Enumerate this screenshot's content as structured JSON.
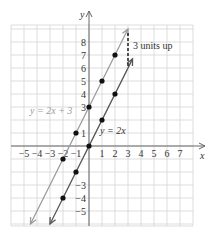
{
  "chart_data": {
    "type": "line",
    "title": "",
    "xlabel": "x",
    "ylabel": "y",
    "xlim": [
      -6,
      8
    ],
    "ylim": [
      -6,
      9
    ],
    "grid": true,
    "x_ticks": [
      -5,
      -4,
      -3,
      -2,
      -1,
      1,
      2,
      3,
      4,
      5,
      6,
      7
    ],
    "y_ticks": [
      -5,
      -4,
      -3,
      1,
      3,
      4,
      5,
      6,
      7,
      8
    ],
    "series": [
      {
        "name": "y = 2x + 3",
        "slope": 2,
        "intercept": 3,
        "color": "#9a9a9a",
        "points": [
          [
            -2,
            -1
          ],
          [
            -1,
            1
          ],
          [
            0,
            3
          ],
          [
            1,
            5
          ],
          [
            2,
            7
          ]
        ]
      },
      {
        "name": "y = 2x",
        "slope": 2,
        "intercept": 0,
        "color": "#555555",
        "points": [
          [
            -2,
            -4
          ],
          [
            -1,
            -2
          ],
          [
            0,
            0
          ],
          [
            1,
            2
          ],
          [
            2,
            4
          ]
        ]
      }
    ],
    "annotations": [
      {
        "text": "3 units up",
        "type": "dashed-arrow",
        "from": [
          3,
          6
        ],
        "to": [
          3,
          9
        ]
      }
    ]
  },
  "labels": {
    "x_axis": "x",
    "y_axis": "y",
    "line1": "y = 2x + 3",
    "line2": "y = 2x",
    "shift": "3 units up"
  }
}
